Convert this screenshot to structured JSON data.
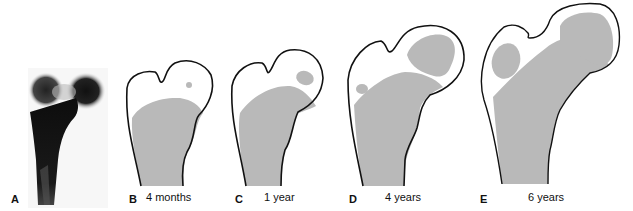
{
  "figure": {
    "colors": {
      "bone_outline": "#111111",
      "ossified_bone": "#b9b9b9",
      "cartilage": "#ffffff",
      "xray_dark": "#111111"
    },
    "panels": [
      {
        "letter": "A",
        "caption": "",
        "type": "radiograph"
      },
      {
        "letter": "B",
        "caption": "4 months",
        "type": "drawing"
      },
      {
        "letter": "C",
        "caption": "1 year",
        "type": "drawing"
      },
      {
        "letter": "D",
        "caption": "4 years",
        "type": "drawing"
      },
      {
        "letter": "E",
        "caption": "6 years",
        "type": "drawing"
      }
    ]
  }
}
